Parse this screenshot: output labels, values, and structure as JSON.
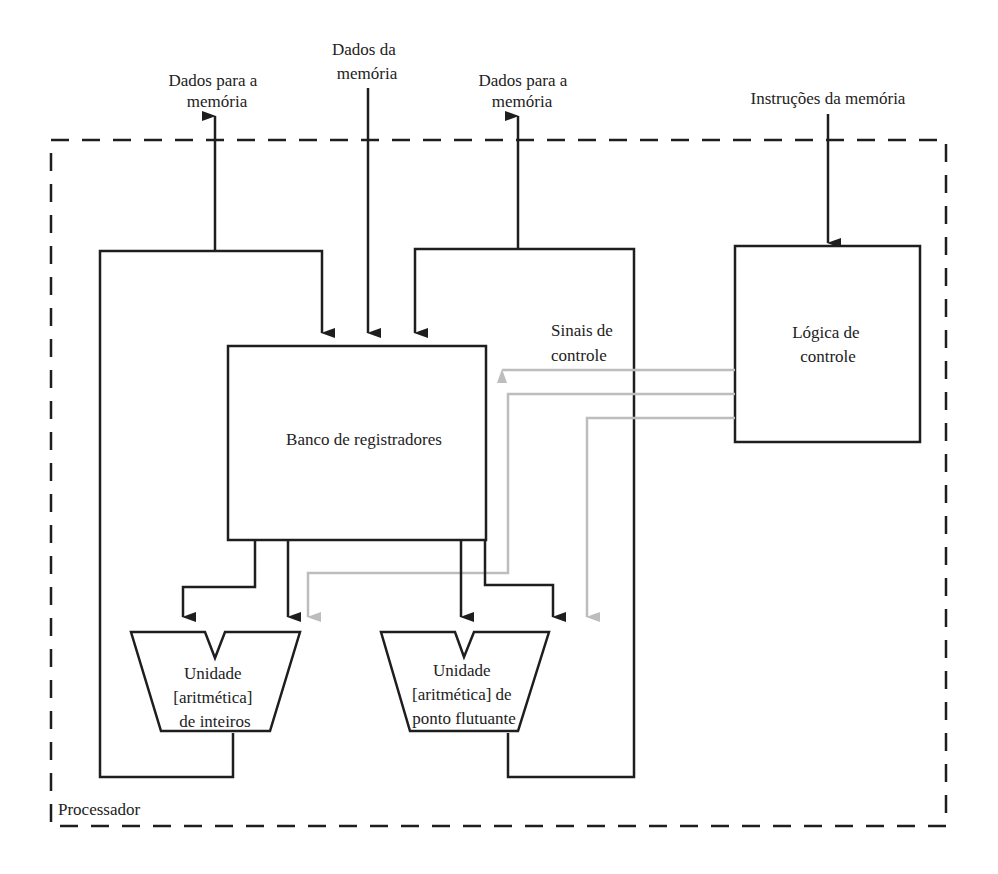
{
  "diagram": {
    "processor_label": "Processador",
    "external_io": {
      "data_to_memory_left": [
        "Dados para a",
        "memória"
      ],
      "data_from_memory": [
        "Dados da",
        "memória"
      ],
      "data_to_memory_right": [
        "Dados para a",
        "memória"
      ],
      "instructions_from_memory": "Instruções da memória"
    },
    "blocks": {
      "register_bank": "Banco de registradores",
      "control_logic": [
        "Lógica de",
        "controle"
      ],
      "integer_unit": [
        "Unidade",
        "[aritmética]",
        "de inteiros"
      ],
      "float_unit": [
        "Unidade",
        "[aritmética] de",
        "ponto flutuante"
      ]
    },
    "control_signals_label": [
      "Sinais de",
      "controle"
    ]
  },
  "colors": {
    "line": "#1e1e1e",
    "control_signal": "#bdbdbd",
    "text": "#222222",
    "background": "#ffffff"
  }
}
